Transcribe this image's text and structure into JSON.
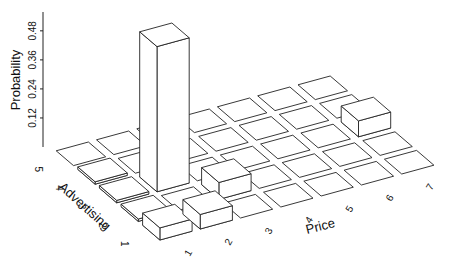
{
  "chart_data": {
    "type": "bar3d",
    "title": "",
    "xlabel": "Price",
    "ylabel": "Advertising",
    "zlabel": "Probability",
    "x_ticks": [
      "1",
      "2",
      "3",
      "4",
      "5",
      "6",
      "7"
    ],
    "y_ticks": [
      "1",
      "2",
      "3",
      "4",
      "5"
    ],
    "z_ticks": [
      "0.12",
      "0.24",
      "0.36",
      "0.48"
    ],
    "z_tick_values": [
      0.12,
      0.24,
      0.36,
      0.48
    ],
    "grid": true,
    "legend": null,
    "note": "Bar positions and heights are approximate estimates read from a 3D oblique projection.",
    "bars": [
      {
        "price": 2,
        "advertising": 3,
        "probability": 0.6
      },
      {
        "price": 1,
        "advertising": 1,
        "probability": 0.05
      },
      {
        "price": 2,
        "advertising": 1,
        "probability": 0.06
      },
      {
        "price": 3,
        "advertising": 2,
        "probability": 0.07
      },
      {
        "price": 7,
        "advertising": 3,
        "probability": 0.066
      },
      {
        "price": 1,
        "advertising": 2,
        "probability": 0.01
      },
      {
        "price": 1,
        "advertising": 3,
        "probability": 0.01
      },
      {
        "price": 1,
        "advertising": 4,
        "probability": 0.01
      }
    ]
  },
  "colors": {
    "line": "#222222",
    "face_top": "#ffffff",
    "face_front": "#ffffff",
    "face_side": "#ffffff",
    "background": "#ffffff"
  }
}
